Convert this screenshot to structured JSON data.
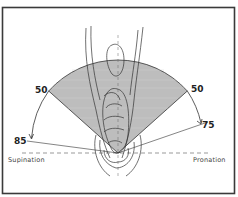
{
  "figure": {
    "frame_color": "#3a3a3a",
    "sector_fill": "#bdbdbd",
    "line_color": "#333333",
    "labels": {
      "upper_left": "50",
      "upper_right": "50",
      "lower_left": "85",
      "lower_right": "75",
      "left_side": "Supination",
      "right_side": "Pronation"
    },
    "ranges": {
      "shaded_left_deg": 50,
      "shaded_right_deg": 50,
      "max_supination_deg": 85,
      "max_pronation_deg": 75
    }
  }
}
